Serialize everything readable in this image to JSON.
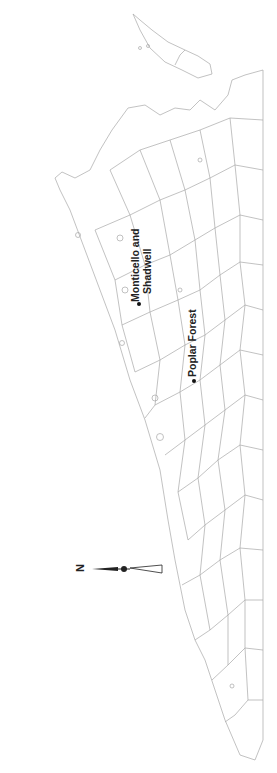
{
  "map": {
    "title": "Virginia counties",
    "orientation": "rotated 90 degrees counter-clockwise (north points left)",
    "stroke_color": "#a8a8a8",
    "places": [
      {
        "name": "Monticello and Shadwell",
        "line1": "Monticello and",
        "line2": "Shadwell"
      },
      {
        "name": "Poplar Forest",
        "line1": "Poplar Forest"
      }
    ],
    "north_arrow": {
      "label": "N"
    }
  }
}
